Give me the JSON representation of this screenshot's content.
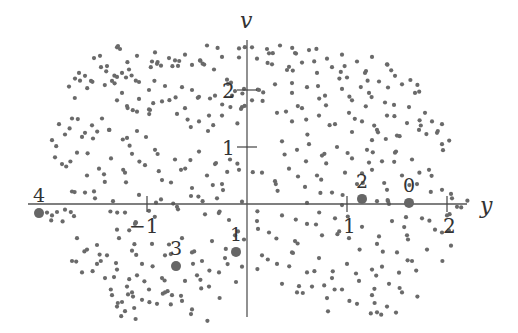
{
  "chart_data": {
    "type": "scatter",
    "title": "",
    "xlabel": "y",
    "ylabel": "v",
    "xlim": [
      -2.2,
      2.2
    ],
    "ylim": [
      -2.0,
      2.8
    ],
    "grid": false,
    "legend": null,
    "x_ticks": [
      {
        "value": -1,
        "label": "−1"
      },
      {
        "value": 1,
        "label": "1"
      },
      {
        "value": 2,
        "label": "2"
      }
    ],
    "y_ticks": [
      {
        "value": 1,
        "label": "1"
      },
      {
        "value": 2,
        "label": "2"
      }
    ],
    "labeled_points": [
      {
        "label": "0",
        "x": 1.62,
        "y": 0.02
      },
      {
        "label": "1",
        "x": -0.11,
        "y": -0.84
      },
      {
        "label": "2",
        "x": 1.15,
        "y": 0.09
      },
      {
        "label": "3",
        "x": -0.71,
        "y": -1.09
      },
      {
        "label": "4",
        "x": -2.08,
        "y": -0.16
      }
    ],
    "scatter_points": [
      [
        -1.3,
        2.75
      ],
      [
        -1.27,
        2.72
      ],
      [
        -1.1,
        2.6
      ],
      [
        -0.92,
        2.66
      ],
      [
        -0.78,
        2.56
      ],
      [
        -0.62,
        2.62
      ],
      [
        -0.47,
        2.52
      ],
      [
        -0.4,
        2.78
      ],
      [
        -0.25,
        2.58
      ],
      [
        -0.08,
        2.73
      ],
      [
        -1.53,
        2.56
      ],
      [
        -1.47,
        2.6
      ],
      [
        -1.4,
        2.42
      ],
      [
        -1.25,
        2.3
      ],
      [
        -1.18,
        2.36
      ],
      [
        -0.95,
        2.5
      ],
      [
        -0.9,
        2.46
      ],
      [
        -0.72,
        2.52
      ],
      [
        -0.55,
        2.44
      ],
      [
        -0.33,
        2.36
      ],
      [
        -1.78,
        2.06
      ],
      [
        -1.72,
        2.2
      ],
      [
        -1.68,
        2.3
      ],
      [
        -1.62,
        2.25
      ],
      [
        -1.56,
        2.16
      ],
      [
        -1.35,
        2.16
      ],
      [
        -1.3,
        2.23
      ],
      [
        -1.08,
        2.14
      ],
      [
        -0.98,
        2.0
      ],
      [
        -0.82,
        2.07
      ],
      [
        -0.65,
        2.05
      ],
      [
        -0.55,
        2.0
      ],
      [
        -0.37,
        1.85
      ],
      [
        -0.2,
        2.18
      ],
      [
        -0.12,
        1.98
      ],
      [
        -0.03,
        2.02
      ],
      [
        -0.05,
        1.7
      ],
      [
        -0.15,
        1.9
      ],
      [
        -0.32,
        1.9
      ],
      [
        -0.38,
        1.55
      ],
      [
        -1.3,
        1.82
      ],
      [
        -1.25,
        1.95
      ],
      [
        -1.2,
        1.72
      ],
      [
        -1.1,
        1.62
      ],
      [
        -0.98,
        1.66
      ],
      [
        -0.85,
        1.8
      ],
      [
        -0.7,
        1.58
      ],
      [
        -0.62,
        1.68
      ],
      [
        -0.48,
        1.45
      ],
      [
        -0.25,
        1.55
      ],
      [
        -1.95,
        1.12
      ],
      [
        -1.88,
        1.4
      ],
      [
        -1.82,
        1.22
      ],
      [
        -1.75,
        1.5
      ],
      [
        -1.62,
        1.25
      ],
      [
        -1.55,
        1.38
      ],
      [
        -1.45,
        1.5
      ],
      [
        -1.38,
        1.3
      ],
      [
        -1.2,
        1.16
      ],
      [
        -1.1,
        1.28
      ],
      [
        -1.92,
        0.82
      ],
      [
        -1.85,
        0.7
      ],
      [
        -1.7,
        0.9
      ],
      [
        -1.6,
        0.5
      ],
      [
        -1.48,
        0.62
      ],
      [
        -1.36,
        0.8
      ],
      [
        -1.22,
        0.55
      ],
      [
        -1.15,
        0.88
      ],
      [
        -1.02,
        0.68
      ],
      [
        -0.92,
        0.95
      ],
      [
        -0.85,
        0.42
      ],
      [
        -0.72,
        0.78
      ],
      [
        -0.66,
        0.6
      ],
      [
        -0.55,
        0.28
      ],
      [
        -0.48,
        0.92
      ],
      [
        -0.4,
        0.5
      ],
      [
        -0.32,
        0.7
      ],
      [
        -0.25,
        0.35
      ],
      [
        -0.17,
        0.78
      ],
      [
        -0.08,
        0.6
      ],
      [
        -1.75,
        0.22
      ],
      [
        -1.62,
        0.2
      ],
      [
        -1.52,
        0.1
      ],
      [
        -1.34,
        0.05
      ],
      [
        -1.22,
        -0.15
      ],
      [
        -1.08,
        0.16
      ],
      [
        -0.98,
        -0.12
      ],
      [
        -0.86,
        0.08
      ],
      [
        -0.7,
        -0.05
      ],
      [
        -0.56,
        0.14
      ],
      [
        -0.42,
        -0.18
      ],
      [
        -0.3,
        0.1
      ],
      [
        -0.18,
        -0.28
      ],
      [
        -0.05,
        0.04
      ],
      [
        -2.0,
        -0.15
      ],
      [
        -1.95,
        -0.2
      ],
      [
        -1.9,
        -0.14
      ],
      [
        -1.82,
        -0.1
      ],
      [
        -1.3,
        -0.45
      ],
      [
        -1.12,
        -0.35
      ],
      [
        -1.7,
        -0.6
      ],
      [
        -1.6,
        -0.8
      ],
      [
        -1.5,
        -0.72
      ],
      [
        -1.4,
        -0.9
      ],
      [
        -1.28,
        -0.6
      ],
      [
        -1.15,
        -0.82
      ],
      [
        -1.05,
        -1.05
      ],
      [
        -0.95,
        -0.7
      ],
      [
        -0.82,
        -0.9
      ],
      [
        -0.65,
        -0.6
      ],
      [
        -0.55,
        -0.85
      ],
      [
        -0.45,
        -1.0
      ],
      [
        -0.35,
        -0.65
      ],
      [
        -0.22,
        -0.95
      ],
      [
        -0.12,
        -0.55
      ],
      [
        -0.05,
        -1.1
      ],
      [
        -1.75,
        -1.0
      ],
      [
        -1.65,
        -1.2
      ],
      [
        -1.5,
        -1.05
      ],
      [
        -1.42,
        -1.3
      ],
      [
        -1.3,
        -1.15
      ],
      [
        -1.2,
        -1.45
      ],
      [
        -1.1,
        -1.25
      ],
      [
        -0.98,
        -1.5
      ],
      [
        -0.85,
        -1.3
      ],
      [
        -0.75,
        -1.6
      ],
      [
        -0.62,
        -1.35
      ],
      [
        -0.5,
        -1.25
      ],
      [
        -0.38,
        -1.45
      ],
      [
        -0.28,
        -1.2
      ],
      [
        -1.35,
        -1.6
      ],
      [
        -1.25,
        -1.72
      ],
      [
        -1.15,
        -1.55
      ],
      [
        -1.05,
        -1.68
      ],
      [
        -0.9,
        -1.75
      ],
      [
        -0.82,
        -1.55
      ],
      [
        -0.65,
        -1.7
      ],
      [
        -0.55,
        -1.85
      ],
      [
        -1.3,
        -1.8
      ],
      [
        -1.22,
        -1.88
      ],
      [
        0.05,
        2.75
      ],
      [
        0.2,
        2.72
      ],
      [
        0.33,
        2.78
      ],
      [
        0.48,
        2.65
      ],
      [
        0.62,
        2.7
      ],
      [
        0.8,
        2.55
      ],
      [
        0.95,
        2.62
      ],
      [
        1.1,
        2.5
      ],
      [
        1.25,
        2.58
      ],
      [
        1.4,
        2.45
      ],
      [
        0.1,
        2.55
      ],
      [
        0.25,
        2.45
      ],
      [
        0.4,
        2.35
      ],
      [
        0.55,
        2.48
      ],
      [
        0.7,
        2.3
      ],
      [
        0.85,
        2.4
      ],
      [
        1.0,
        2.22
      ],
      [
        1.18,
        2.3
      ],
      [
        1.32,
        2.15
      ],
      [
        1.48,
        2.25
      ],
      [
        0.12,
        2.0
      ],
      [
        0.05,
        1.82
      ],
      [
        0.28,
        2.1
      ],
      [
        0.45,
        1.95
      ],
      [
        0.6,
        2.05
      ],
      [
        0.78,
        1.9
      ],
      [
        0.95,
        2.02
      ],
      [
        1.05,
        1.82
      ],
      [
        1.22,
        1.95
      ],
      [
        1.38,
        1.78
      ],
      [
        1.55,
        2.1
      ],
      [
        1.68,
        1.95
      ],
      [
        1.62,
        1.7
      ],
      [
        1.78,
        1.6
      ],
      [
        1.85,
        1.45
      ],
      [
        1.9,
        1.25
      ],
      [
        1.95,
        1.05
      ],
      [
        1.72,
        1.3
      ],
      [
        1.6,
        1.42
      ],
      [
        1.5,
        1.2
      ],
      [
        0.3,
        1.6
      ],
      [
        0.45,
        1.45
      ],
      [
        0.55,
        1.68
      ],
      [
        0.72,
        1.55
      ],
      [
        0.88,
        1.4
      ],
      [
        1.02,
        1.6
      ],
      [
        1.15,
        1.45
      ],
      [
        1.3,
        1.3
      ],
      [
        1.4,
        1.55
      ],
      [
        1.25,
        1.12
      ],
      [
        0.35,
        1.1
      ],
      [
        0.5,
        0.95
      ],
      [
        0.62,
        1.05
      ],
      [
        0.75,
        0.85
      ],
      [
        0.9,
        1.0
      ],
      [
        1.05,
        0.8
      ],
      [
        1.2,
        0.95
      ],
      [
        1.35,
        0.75
      ],
      [
        1.48,
        0.9
      ],
      [
        1.65,
        0.78
      ],
      [
        0.15,
        0.55
      ],
      [
        0.28,
        0.4
      ],
      [
        0.42,
        0.62
      ],
      [
        0.58,
        0.3
      ],
      [
        0.7,
        0.5
      ],
      [
        0.85,
        0.2
      ],
      [
        0.98,
        0.55
      ],
      [
        1.1,
        0.35
      ],
      [
        1.25,
        0.6
      ],
      [
        1.4,
        0.25
      ],
      [
        1.55,
        0.5
      ],
      [
        1.7,
        0.35
      ],
      [
        1.82,
        0.6
      ],
      [
        1.95,
        0.25
      ],
      [
        2.05,
        0.1
      ],
      [
        2.1,
        -0.05
      ],
      [
        1.3,
        0.05
      ],
      [
        1.42,
        0.0
      ],
      [
        0.95,
        -0.02
      ],
      [
        0.6,
        0.02
      ],
      [
        0.1,
        -0.3
      ],
      [
        0.22,
        -0.5
      ],
      [
        0.35,
        -0.2
      ],
      [
        0.48,
        -0.65
      ],
      [
        0.6,
        -0.35
      ],
      [
        0.75,
        -0.55
      ],
      [
        0.88,
        -0.25
      ],
      [
        1.02,
        -0.6
      ],
      [
        1.15,
        -0.4
      ],
      [
        1.3,
        -0.7
      ],
      [
        1.45,
        -0.3
      ],
      [
        1.6,
        -0.55
      ],
      [
        1.75,
        -0.25
      ],
      [
        1.88,
        -0.45
      ],
      [
        2.0,
        -0.2
      ],
      [
        1.95,
        -0.5
      ],
      [
        1.8,
        -0.8
      ],
      [
        1.65,
        -1.0
      ],
      [
        1.5,
        -0.85
      ],
      [
        1.35,
        -1.1
      ],
      [
        0.15,
        -0.9
      ],
      [
        0.3,
        -1.05
      ],
      [
        0.45,
        -0.85
      ],
      [
        0.6,
        -1.2
      ],
      [
        0.72,
        -0.95
      ],
      [
        0.85,
        -1.3
      ],
      [
        1.0,
        -1.05
      ],
      [
        1.12,
        -1.35
      ],
      [
        1.25,
        -1.15
      ],
      [
        1.42,
        -1.4
      ],
      [
        0.35,
        -1.4
      ],
      [
        0.5,
        -1.55
      ],
      [
        0.65,
        -1.45
      ],
      [
        0.8,
        -1.65
      ],
      [
        0.95,
        -1.5
      ],
      [
        1.1,
        -1.75
      ],
      [
        1.25,
        -1.6
      ],
      [
        1.4,
        -1.8
      ],
      [
        1.55,
        -1.55
      ],
      [
        1.3,
        -1.9
      ]
    ]
  }
}
